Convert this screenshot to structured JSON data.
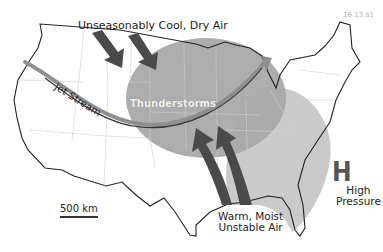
{
  "figure_id": "16.13.a1",
  "labels": {
    "cool_air": "Unseasonably Cool, Dry Air",
    "jet_stream": "Jet Stream",
    "thunderstorms": "Thunderstorms",
    "warm_air_line1": "Warm, Moist",
    "warm_air_line2": "Unstable Air",
    "high_symbol": "H",
    "high_line1": "High",
    "high_line2": "Pressure",
    "scale": "500 km"
  },
  "colors": {
    "thunderstorm_zone": "#a9a9a9",
    "high_pressure_zone": "#c4c4c4",
    "arrow_dark": "#4a4a4a",
    "jet_stream": "#9a9a9a",
    "coastline": "#222222",
    "state_lines": "#cfcfcf"
  }
}
